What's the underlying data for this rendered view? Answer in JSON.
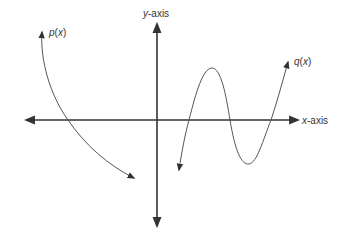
{
  "diagram": {
    "axes": {
      "x_label_var": "x",
      "x_label_suffix": "-axis",
      "y_label_var": "y",
      "y_label_suffix": "-axis"
    },
    "functions": [
      {
        "name": "p",
        "label_fn": "p",
        "label_open": "(",
        "label_var": "x",
        "label_close": ")",
        "description": "decreasing curve, arrow up-left, arrow down-right, crosses x-axis once left of y-axis"
      },
      {
        "name": "q",
        "label_fn": "q",
        "label_open": "(",
        "label_var": "x",
        "label_close": ")",
        "description": "cubic-like curve right of y-axis, starts arrow down, one local max above axis, one local min below axis, rises with arrow up; three x-intercepts"
      }
    ],
    "colors": {
      "axis": "#333333",
      "curve": "#555555",
      "text": "#333333",
      "background": "#ffffff"
    }
  }
}
